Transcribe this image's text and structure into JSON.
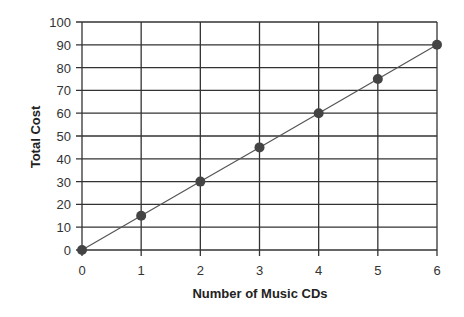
{
  "chart_data": {
    "type": "line",
    "title": "",
    "xlabel": "Number of Music CDs",
    "ylabel": "Total  Cost",
    "x": [
      0,
      1,
      2,
      3,
      4,
      5,
      6
    ],
    "series": [
      {
        "name": "Total Cost",
        "values": [
          0,
          15,
          30,
          45,
          60,
          75,
          90
        ]
      }
    ],
    "xlim": [
      0,
      6
    ],
    "ylim": [
      0,
      100
    ],
    "x_ticks": [
      "0",
      "1",
      "2",
      "3",
      "4",
      "5",
      "6"
    ],
    "y_ticks": [
      "0",
      "10",
      "20",
      "30",
      "40",
      "50",
      "60",
      "70",
      "80",
      "90",
      "100"
    ],
    "grid": true,
    "legend": "none",
    "markers": true
  },
  "colors": {
    "grid": "#333333",
    "line": "#555555",
    "marker": "#444444"
  }
}
